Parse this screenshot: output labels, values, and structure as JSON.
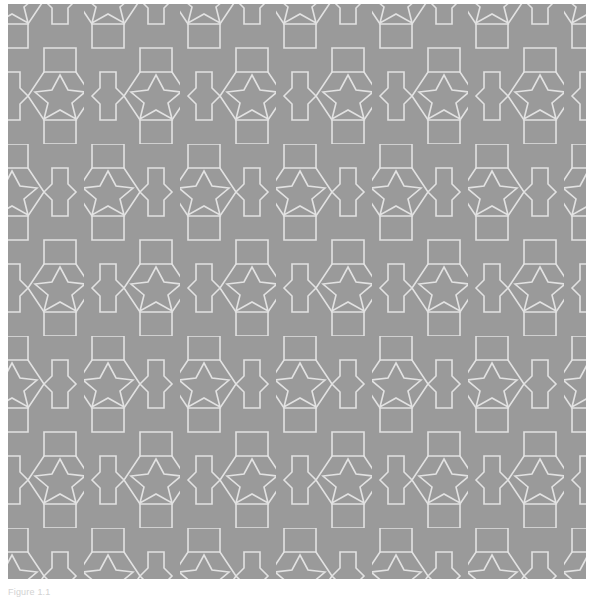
{
  "document": {
    "page_background": "#ffffff"
  },
  "figure": {
    "name": "geometric-tessellation",
    "caption": "Figure 1.1",
    "colors": {
      "background": "#9a9a9a",
      "line": "#e2e2e2",
      "caption_text": "#d2d2d2",
      "page": "#ffffff"
    },
    "geometry": {
      "type": "periodic-tiling",
      "motif": "hexagon-with-inscribed-five-pointed-star",
      "secondary_motif": "square-cross-connector",
      "tile_width_px": 96,
      "tile_height_px": 96,
      "row_offset_px": 48,
      "stroke_width_px": 1.6,
      "columns": 7,
      "rows": 7,
      "origin_x_px": 8,
      "origin_y_px": 4,
      "pattern_width_px": 578,
      "pattern_height_px": 575
    }
  }
}
